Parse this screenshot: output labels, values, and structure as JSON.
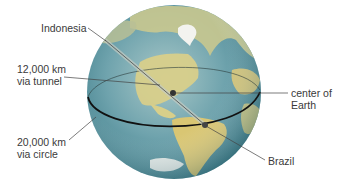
{
  "diagram": {
    "labels": {
      "indonesia": "Indonesia",
      "tunnel_line1": "12,000 km",
      "tunnel_line2": "via tunnel",
      "circle_line1": "20,000 km",
      "circle_line2": "via circle",
      "center_line1": "center of",
      "center_line2": "Earth",
      "brazil": "Brazil"
    },
    "colors": {
      "ocean": "#5f9aa6",
      "ocean_dark": "#3f7f8c",
      "land": "#d9c97a",
      "ice": "#f2f2ee",
      "line": "#2a2a2a",
      "text": "#3a3a3a"
    }
  }
}
